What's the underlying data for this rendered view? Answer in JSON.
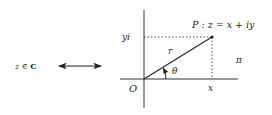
{
  "left_label": {
    "var": "z",
    "rel": "∈",
    "set": "C"
  },
  "arrow": {
    "type": "double-headed",
    "meaning": "correspondence"
  },
  "plane": {
    "origin_label": "O",
    "x_tick_label": "x",
    "y_tick_label": "yi",
    "point_label": "P : z = x + iy",
    "radius_label": "r",
    "angle_label": "θ",
    "plane_label": "π"
  },
  "colors": {
    "ink": "#222222",
    "background": "#ffffff"
  }
}
